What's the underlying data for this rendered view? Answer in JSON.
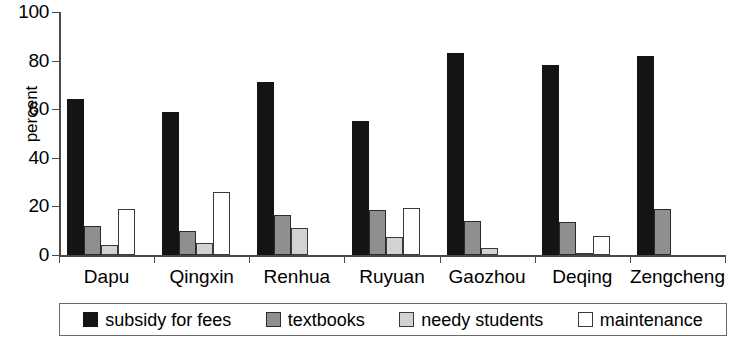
{
  "chart_data": {
    "type": "bar",
    "title": "",
    "xlabel": "",
    "ylabel": "percent",
    "ylim": [
      0,
      100
    ],
    "yticks": [
      0,
      20,
      40,
      60,
      80,
      100
    ],
    "grid": false,
    "legend_position": "bottom",
    "categories": [
      "Dapu",
      "Qingxin",
      "Renhua",
      "Ruyuan",
      "Gaozhou",
      "Deqing",
      "Zengcheng"
    ],
    "series": [
      {
        "name": "subsidy for fees",
        "color": "#141414",
        "values": [
          64,
          59,
          71,
          55,
          83,
          78,
          82
        ]
      },
      {
        "name": "textbooks",
        "color": "#8f8f8f",
        "values": [
          12,
          10,
          16.5,
          18.5,
          14,
          13.5,
          19
        ]
      },
      {
        "name": "needy students",
        "color": "#d2d2d2",
        "values": [
          4,
          5,
          11,
          7.5,
          3,
          1,
          0
        ]
      },
      {
        "name": "maintenance",
        "color": "#ffffff",
        "values": [
          19,
          26,
          0,
          19.5,
          0,
          8,
          0
        ]
      }
    ]
  },
  "axis": {
    "tick_labels": [
      "0",
      "20",
      "40",
      "60",
      "80",
      "100"
    ],
    "y_axis_title": "percent"
  }
}
